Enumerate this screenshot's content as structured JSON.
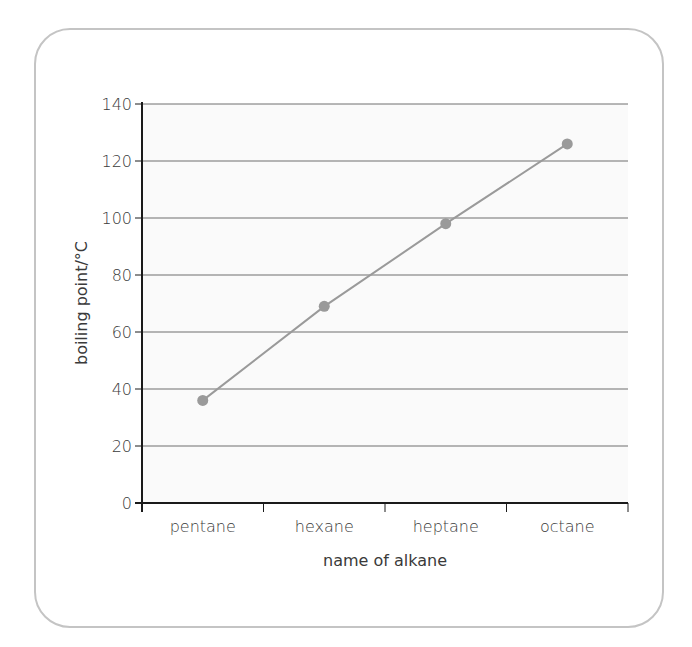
{
  "chart_data": {
    "type": "line",
    "title": "",
    "xlabel": "name of alkane",
    "ylabel": "boiling point/°C",
    "categories": [
      "pentane",
      "hexane",
      "heptane",
      "octane"
    ],
    "series": [
      {
        "name": "boiling point",
        "values": [
          36,
          69,
          98,
          126
        ]
      }
    ],
    "ylim": [
      0,
      140
    ],
    "yticks": [
      0,
      20,
      40,
      60,
      80,
      100,
      120,
      140
    ],
    "grid": true,
    "legend": "none",
    "colors": {
      "line": "#9a9a9a",
      "marker": "#9a9a9a",
      "grid": "#6e6e6e",
      "axis": "#1a1a1a",
      "plot_background": "#fafafa",
      "frame_border": "#c4c4c4"
    }
  }
}
